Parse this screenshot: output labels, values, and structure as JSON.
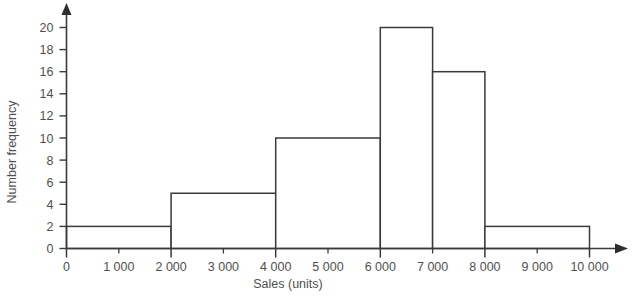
{
  "chart_data": {
    "type": "bar",
    "title": "",
    "subtitle": "",
    "xlabel": "Sales (units)",
    "ylabel": "Number frequency",
    "grid": false,
    "legend": false,
    "legend_position": "none",
    "xlim": [
      0,
      10000
    ],
    "ylim": [
      0,
      20
    ],
    "x_tick_labels": [
      "0",
      "1 000",
      "2 000",
      "3 000",
      "4 000",
      "5 000",
      "6 000",
      "7 000",
      "8 000",
      "9 000",
      "10 000"
    ],
    "x_tick_values": [
      0,
      1000,
      2000,
      3000,
      4000,
      5000,
      6000,
      7000,
      8000,
      9000,
      10000
    ],
    "x_major_ticks": [
      0,
      2000,
      4000,
      6000,
      8000,
      10000
    ],
    "x_minor_ticks": [
      1000,
      3000,
      5000,
      7000,
      9000
    ],
    "y_tick_labels": [
      "0",
      "2",
      "4",
      "6",
      "8",
      "10",
      "12",
      "14",
      "16",
      "18",
      "20"
    ],
    "y_tick_values": [
      0,
      2,
      4,
      6,
      8,
      10,
      12,
      14,
      16,
      18,
      20
    ],
    "categories": [
      "0-2000",
      "2000-4000",
      "4000-6000",
      "6000-7000",
      "7000-8000",
      "8000-10000"
    ],
    "values": [
      2,
      5,
      10,
      20,
      16,
      2
    ],
    "bins": [
      {
        "start": 0,
        "end": 2000,
        "frequency": 2
      },
      {
        "start": 2000,
        "end": 4000,
        "frequency": 5
      },
      {
        "start": 4000,
        "end": 6000,
        "frequency": 10
      },
      {
        "start": 6000,
        "end": 7000,
        "frequency": 20
      },
      {
        "start": 7000,
        "end": 8000,
        "frequency": 16
      },
      {
        "start": 8000,
        "end": 10000,
        "frequency": 2
      }
    ],
    "colors": {
      "line": "#3a3a3a",
      "fill": "#ffffff",
      "text": "#4f4f4f",
      "background": "#ffffff"
    }
  }
}
